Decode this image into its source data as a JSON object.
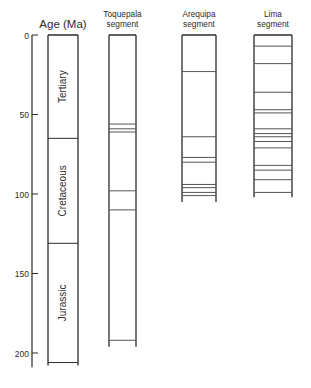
{
  "axis": {
    "title": "Age (Ma)",
    "ticks": [
      0,
      50,
      100,
      150,
      200
    ],
    "range": [
      0,
      207
    ]
  },
  "age_column": {
    "periods": [
      {
        "name": "Tertiary",
        "from": 0,
        "to": 65
      },
      {
        "name": "Cretaceous",
        "from": 65,
        "to": 131
      },
      {
        "name": "Jurassic",
        "from": 131,
        "to": 206
      }
    ]
  },
  "segments": [
    {
      "title_line1": "Toquepala",
      "title_line2": "segment",
      "top": 0,
      "bottom": 196,
      "boundaries": [
        56,
        59,
        61,
        98,
        110,
        192
      ]
    },
    {
      "title_line1": "Arequipa",
      "title_line2": "segment",
      "top": 0,
      "bottom": 105,
      "boundaries": [
        23,
        64,
        77,
        80,
        94,
        96,
        99,
        101
      ]
    },
    {
      "title_line1": "Lima",
      "title_line2": "segment",
      "top": 0,
      "bottom": 102,
      "boundaries": [
        7,
        18,
        36,
        47,
        49,
        59,
        62,
        64,
        67,
        71,
        82,
        85,
        91,
        99
      ]
    }
  ],
  "colors": {
    "line": "#2b2b2b",
    "thin_line": "#555555",
    "background": "#ffffff"
  },
  "chart_data": {
    "type": "table",
    "ylabel": "Age (Ma)",
    "ylim": [
      0,
      207
    ],
    "y_ticks": [
      0,
      50,
      100,
      150,
      200
    ],
    "columns": [
      "Age (Ma)",
      "Toquepala segment",
      "Arequipa segment",
      "Lima segment"
    ],
    "periods": [
      {
        "name": "Tertiary",
        "from": 0,
        "to": 65
      },
      {
        "name": "Cretaceous",
        "from": 65,
        "to": 131
      },
      {
        "name": "Jurassic",
        "from": 131,
        "to": 206
      }
    ],
    "series": [
      {
        "name": "Toquepala segment",
        "range": [
          0,
          196
        ],
        "boundaries": [
          56,
          59,
          61,
          98,
          110,
          192
        ]
      },
      {
        "name": "Arequipa segment",
        "range": [
          0,
          105
        ],
        "boundaries": [
          23,
          64,
          77,
          80,
          94,
          96,
          99,
          101
        ]
      },
      {
        "name": "Lima segment",
        "range": [
          0,
          102
        ],
        "boundaries": [
          7,
          18,
          36,
          47,
          49,
          59,
          62,
          64,
          67,
          71,
          82,
          85,
          91,
          99
        ]
      }
    ]
  }
}
